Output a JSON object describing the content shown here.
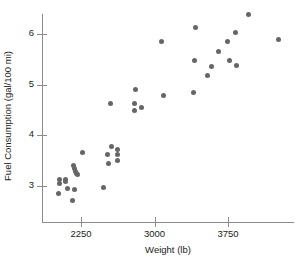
{
  "chart_data": {
    "type": "scatter",
    "title": "",
    "xlabel": "Weight (lb)",
    "ylabel": "Fuel Consumption (gal/100 mi)",
    "xlim": [
      1950,
      4350
    ],
    "ylim": [
      2.55,
      6.55
    ],
    "xticks": [
      2250,
      3000,
      3750
    ],
    "xtick_labels": [
      "2250",
      "3000",
      "3750"
    ],
    "yticks": [
      3,
      4,
      5,
      6
    ],
    "ytick_labels": [
      "3",
      "4",
      "5",
      "6"
    ],
    "grid": false,
    "legend": false,
    "marker_color": "#666666",
    "axis_color": "#8c8c8c",
    "points": [
      {
        "x": 2035,
        "y": 3.12
      },
      {
        "x": 2035,
        "y": 3.05
      },
      {
        "x": 2025,
        "y": 2.85
      },
      {
        "x": 2090,
        "y": 3.13
      },
      {
        "x": 2095,
        "y": 3.08
      },
      {
        "x": 2110,
        "y": 2.96
      },
      {
        "x": 2175,
        "y": 3.4
      },
      {
        "x": 2180,
        "y": 3.34
      },
      {
        "x": 2195,
        "y": 3.28
      },
      {
        "x": 2200,
        "y": 3.24
      },
      {
        "x": 2215,
        "y": 3.22
      },
      {
        "x": 2185,
        "y": 2.94
      },
      {
        "x": 2165,
        "y": 2.72
      },
      {
        "x": 2270,
        "y": 3.67
      },
      {
        "x": 2525,
        "y": 3.62
      },
      {
        "x": 2530,
        "y": 3.45
      },
      {
        "x": 2560,
        "y": 3.78
      },
      {
        "x": 2555,
        "y": 4.63
      },
      {
        "x": 2480,
        "y": 2.97
      },
      {
        "x": 2625,
        "y": 3.72
      },
      {
        "x": 2620,
        "y": 3.63
      },
      {
        "x": 2625,
        "y": 3.51
      },
      {
        "x": 2805,
        "y": 4.91
      },
      {
        "x": 2795,
        "y": 4.62
      },
      {
        "x": 2800,
        "y": 4.5
      },
      {
        "x": 2865,
        "y": 4.54
      },
      {
        "x": 3075,
        "y": 5.86
      },
      {
        "x": 3090,
        "y": 4.78
      },
      {
        "x": 3415,
        "y": 6.13
      },
      {
        "x": 3405,
        "y": 5.48
      },
      {
        "x": 3395,
        "y": 4.84
      },
      {
        "x": 3585,
        "y": 5.35
      },
      {
        "x": 3545,
        "y": 5.18
      },
      {
        "x": 3650,
        "y": 5.66
      },
      {
        "x": 3745,
        "y": 5.86
      },
      {
        "x": 3765,
        "y": 5.48
      },
      {
        "x": 3830,
        "y": 6.03
      },
      {
        "x": 3840,
        "y": 5.37
      },
      {
        "x": 3955,
        "y": 6.38
      },
      {
        "x": 4265,
        "y": 5.89
      }
    ]
  }
}
